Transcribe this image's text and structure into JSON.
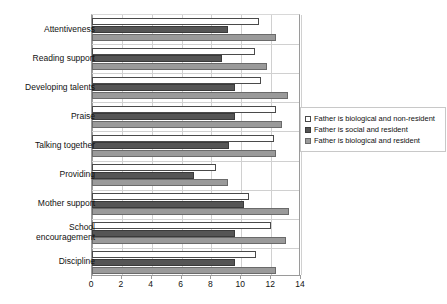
{
  "chart_data": {
    "type": "bar",
    "orientation": "horizontal",
    "title": "",
    "xlabel": "",
    "ylabel": "",
    "xlim": [
      0,
      14
    ],
    "xticks": [
      0,
      2,
      4,
      6,
      8,
      10,
      12,
      14
    ],
    "grid": true,
    "legend_position": "right",
    "categories": [
      "Attentiveness",
      "Reading support",
      "Developing talents",
      "Praise",
      "Talking together",
      "Providing",
      "Mother support",
      "School\nencouragement",
      "Discipline"
    ],
    "series": [
      {
        "name": "Father is biological and non-resident",
        "color": "#ffffff",
        "values": [
          11.2,
          10.9,
          11.3,
          12.3,
          12.2,
          8.3,
          10.5,
          12.0,
          11.0
        ]
      },
      {
        "name": "Father is social and resident",
        "color": "#555555",
        "values": [
          9.1,
          8.7,
          9.6,
          9.6,
          9.2,
          6.8,
          10.2,
          9.6,
          9.6
        ]
      },
      {
        "name": "Father is biological and resident",
        "color": "#9a9a9a",
        "values": [
          12.3,
          11.7,
          13.1,
          12.7,
          12.3,
          9.1,
          13.2,
          13.0,
          12.3
        ]
      }
    ]
  },
  "legend": {
    "items": [
      "Father is biological and non-resident",
      "Father is social and resident",
      "Father is biological and resident"
    ]
  }
}
